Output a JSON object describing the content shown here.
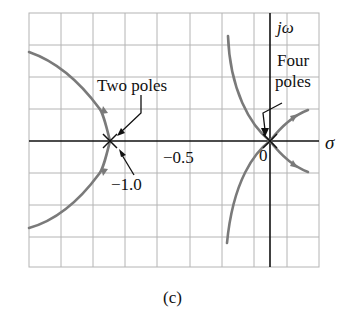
{
  "figure": {
    "caption": "(c)",
    "axes": {
      "real_axis_label": "σ",
      "imag_axis_label": "jω",
      "tick_labels": [
        "−0.5",
        "−1.0",
        "0"
      ]
    },
    "annotations": {
      "two_poles": "Two poles",
      "four_poles_line1": "Four",
      "four_poles_line2": "poles"
    },
    "poles": [
      {
        "location": -1.0,
        "multiplicity": 2
      },
      {
        "location": 0,
        "multiplicity": 4
      }
    ],
    "colors": {
      "locus": "#7a7a7a",
      "grid": "#b4b4b4",
      "axis": "#111111"
    }
  }
}
